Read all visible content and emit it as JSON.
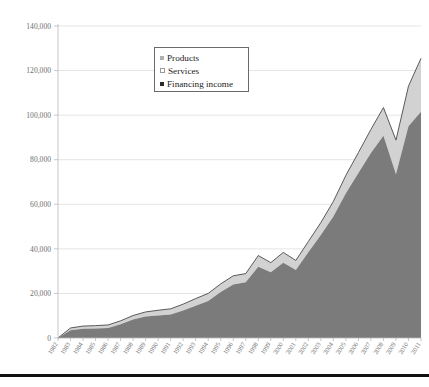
{
  "chart_data": {
    "type": "area",
    "stacked": true,
    "title": "",
    "subtitle": "",
    "xlabel": "",
    "ylabel": "",
    "ylim": [
      0,
      140000
    ],
    "ytick_step": 20000,
    "ytick_labels": [
      "0",
      "20,000",
      "40,000",
      "60,000",
      "80,000",
      "100,000",
      "120,000",
      "140,000"
    ],
    "ytick_values": [
      0,
      20000,
      40000,
      60000,
      80000,
      100000,
      120000,
      140000
    ],
    "grid": true,
    "legend_position": "upper-left-inset",
    "categories": [
      "1982",
      "1983",
      "1984",
      "1985",
      "1986",
      "1987",
      "1988",
      "1989",
      "1990",
      "1991",
      "1992",
      "1993",
      "1994",
      "1995",
      "1996",
      "1997",
      "1998",
      "1999",
      "2000",
      "2001",
      "2002",
      "2003",
      "2004",
      "2005",
      "2006",
      "2007",
      "2008",
      "2009",
      "2010",
      "2011"
    ],
    "series": [
      {
        "name": "Financing income",
        "color": "#7b7b7b",
        "marker": "square",
        "values": [
          0,
          3500,
          4200,
          4300,
          4500,
          6200,
          8300,
          9600,
          10100,
          10500,
          12300,
          14500,
          16600,
          20600,
          24000,
          25000,
          32000,
          29500,
          33800,
          30500,
          38500,
          46200,
          54500,
          65000,
          74000,
          83000,
          90800,
          73500,
          95000,
          101500
        ]
      },
      {
        "name": "Services",
        "color": "#d2d2d2",
        "marker": "square-outline",
        "values": [
          0,
          600,
          700,
          750,
          800,
          900,
          1100,
          1300,
          1500,
          1700,
          1900,
          2100,
          2200,
          2400,
          2500,
          2500,
          3500,
          3000,
          3200,
          3000,
          3400,
          4000,
          5000,
          6000,
          7000,
          8200,
          10000,
          12500,
          15000,
          18000
        ]
      },
      {
        "name": "Products",
        "color": "#d2d2d2",
        "marker": "square",
        "values": [
          0,
          400,
          450,
          500,
          550,
          600,
          700,
          800,
          850,
          900,
          1000,
          1100,
          1200,
          1300,
          1400,
          1400,
          1500,
          1300,
          1400,
          1300,
          1400,
          1600,
          1800,
          2000,
          2200,
          2400,
          2600,
          2800,
          3000,
          6000
        ]
      }
    ],
    "totals": [
      0,
      4500,
      5350,
      5550,
      5850,
      7700,
      10100,
      11700,
      12450,
      13100,
      15200,
      17700,
      20000,
      24300,
      27900,
      28900,
      37000,
      33800,
      38400,
      34800,
      43300,
      51800,
      61300,
      73000,
      83200,
      93600,
      103400,
      88800,
      113000,
      125500
    ],
    "legend": [
      {
        "label": "Products",
        "color": "#b0b0b0"
      },
      {
        "label": "Services",
        "color": "#ffffff"
      },
      {
        "label": "Financing income",
        "color": "#2a2a2a"
      }
    ]
  }
}
